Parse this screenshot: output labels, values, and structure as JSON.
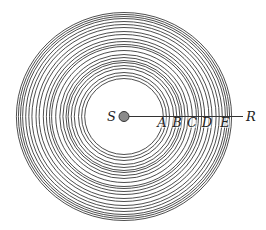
{
  "diagram": {
    "type": "concentric-wave-fronts",
    "source": {
      "label": "S",
      "cx": 124,
      "cy": 116.5,
      "r": 5,
      "fill": "#8a8a8a",
      "stroke": "#333333"
    },
    "receiver_label": "R",
    "ray": {
      "x1": 129,
      "y1": 116.5,
      "x2": 243,
      "y2": 116.5,
      "color": "#333333"
    },
    "ring_color": "#3a3a3a",
    "ring_scale_x": 1.035,
    "ring_radii": [
      38,
      41,
      44,
      48,
      51,
      54,
      56,
      59,
      62,
      66,
      70,
      72,
      75,
      78,
      82,
      85,
      89,
      92,
      95,
      98,
      100,
      102,
      104
    ],
    "points": [
      {
        "label": "A",
        "x": 162
      },
      {
        "label": "B",
        "x": 177
      },
      {
        "label": "C",
        "x": 192
      },
      {
        "label": "D",
        "x": 207
      },
      {
        "label": "E",
        "x": 225
      }
    ],
    "points_baseline_y": 127,
    "source_label_pos": {
      "x": 107,
      "y": 121
    },
    "receiver_label_pos": {
      "x": 246,
      "y": 121
    }
  }
}
